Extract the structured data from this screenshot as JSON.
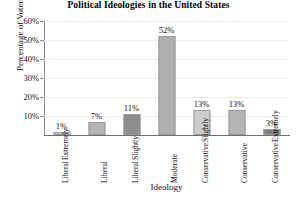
{
  "chart_data": {
    "type": "bar",
    "title": "Political Ideologies in the United States",
    "xlabel": "Ideology",
    "ylabel": "Percentage of Voters",
    "categories": [
      "Extremely Liberal",
      "Liberal",
      "Slightly Liberal",
      "Moderate",
      "Slightly Conservative",
      "Conservative",
      "Extremely Conservative"
    ],
    "category_lines": [
      [
        "Extremely",
        "Liberal"
      ],
      [
        "Liberal"
      ],
      [
        "Slightly",
        "Liberal"
      ],
      [
        "Moderate"
      ],
      [
        "Slightly",
        "Conservative"
      ],
      [
        "Conservative"
      ],
      [
        "Extremely",
        "Conservative"
      ]
    ],
    "values": [
      1,
      7,
      11,
      52,
      13,
      13,
      3
    ],
    "value_labels": [
      "1%",
      "7%",
      "11%",
      "52%",
      "13%",
      "13%",
      "3%"
    ],
    "bar_colors": [
      "#c9c9c9",
      "#b4b4b4",
      "#8c8c8c",
      "#b0b0b0",
      "#cccccc",
      "#b5b5b5",
      "#808080"
    ],
    "bar_border_color": "#9a9a9a",
    "ylim": [
      0,
      60
    ],
    "yticks": [
      10,
      20,
      30,
      40,
      50,
      60
    ],
    "ytick_labels": [
      "10%",
      "20%",
      "30%",
      "40%",
      "50%",
      "60%"
    ],
    "grid": true,
    "grid_color": "#ececec",
    "legend": null,
    "axis_color": "#8a8a8a",
    "background": "#ffffff"
  }
}
